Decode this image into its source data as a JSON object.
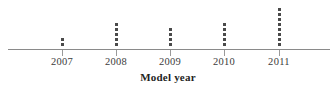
{
  "chart_data": {
    "type": "scatter",
    "plot_style": "dotplot",
    "title": "",
    "xlabel": "Model year",
    "ylabel": "",
    "categories": [
      "2007",
      "2008",
      "2009",
      "2010",
      "2011"
    ],
    "values": [
      2,
      5,
      4,
      5,
      8
    ],
    "counts_description": "Number of stacked dots above each model year tick",
    "series": [
      {
        "name": "Model year counts",
        "values": [
          2,
          5,
          4,
          5,
          8
        ]
      }
    ],
    "xlim": [
      2006.5,
      2011.5
    ],
    "ylim": [
      0,
      8
    ],
    "grid": false,
    "legend": false,
    "legend_position": "none",
    "annotations": [],
    "colors": {
      "dot": "#4a4a4a",
      "axis": "#8a8a8a",
      "tick": "#9a9a9a",
      "tick_label": "#3b3b3b",
      "axis_title": "#1f1f1f",
      "background": "#ffffff"
    },
    "points": [
      {
        "category": "2007",
        "count": 2
      },
      {
        "category": "2008",
        "count": 5
      },
      {
        "category": "2009",
        "count": 4
      },
      {
        "category": "2010",
        "count": 5
      },
      {
        "category": "2011",
        "count": 8
      }
    ]
  },
  "axis": {
    "title": "Model year",
    "tick_labels": [
      "2007",
      "2008",
      "2009",
      "2010",
      "2011"
    ],
    "tick_positions_px": [
      62,
      116,
      170,
      224,
      279
    ]
  }
}
